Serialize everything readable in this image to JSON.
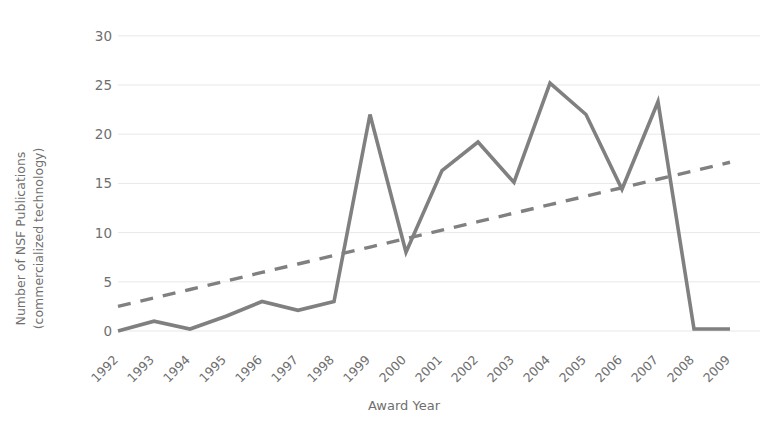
{
  "chart_data": {
    "type": "line",
    "title": "",
    "xlabel": "Award Year",
    "ylabel": "Number of NSF Publications\n(commercialized technology)",
    "categories": [
      "1992",
      "1993",
      "1994",
      "1995",
      "1996",
      "1997",
      "1998",
      "1999",
      "2000",
      "2001",
      "2002",
      "2003",
      "2004",
      "2005",
      "2006",
      "2007",
      "2008",
      "2009"
    ],
    "yticks": [
      0,
      5,
      10,
      15,
      20,
      25,
      30
    ],
    "ylim": [
      0,
      30
    ],
    "grid": true,
    "legend": "none",
    "series": [
      {
        "name": "Number of NSF Publications (commercialized technology)",
        "style": "solid",
        "color": "#808080",
        "values": [
          0,
          1,
          0.2,
          1.5,
          3,
          2.1,
          3,
          22,
          8,
          16.3,
          19.2,
          15.1,
          25.2,
          22,
          14.4,
          23.3,
          0.2,
          0.2
        ]
      },
      {
        "name": "Linear trendline",
        "style": "dashed",
        "color": "#808080",
        "values": [
          2.5,
          3.36,
          4.22,
          5.08,
          5.95,
          6.81,
          7.67,
          8.53,
          9.39,
          10.25,
          11.11,
          11.98,
          12.84,
          13.7,
          14.56,
          15.42,
          16.28,
          17.15
        ]
      }
    ],
    "colors": {
      "series_line": "#808080",
      "trendline": "#808080",
      "gridline": "#e8e8ea",
      "tick_text": "#6f6f6f",
      "background": "#ffffff"
    }
  },
  "axis": {
    "x_title": "Award Year",
    "y_title": "Number of NSF Publications\n(commercialized technology)"
  },
  "yticks": {
    "t0": "0",
    "t1": "5",
    "t2": "10",
    "t3": "15",
    "t4": "20",
    "t5": "25",
    "t6": "30"
  },
  "xticks": {
    "t0": "1992",
    "t1": "1993",
    "t2": "1994",
    "t3": "1995",
    "t4": "1996",
    "t5": "1997",
    "t6": "1998",
    "t7": "1999",
    "t8": "2000",
    "t9": "2001",
    "t10": "2002",
    "t11": "2003",
    "t12": "2004",
    "t13": "2005",
    "t14": "2006",
    "t15": "2007",
    "t16": "2008",
    "t17": "2009"
  }
}
